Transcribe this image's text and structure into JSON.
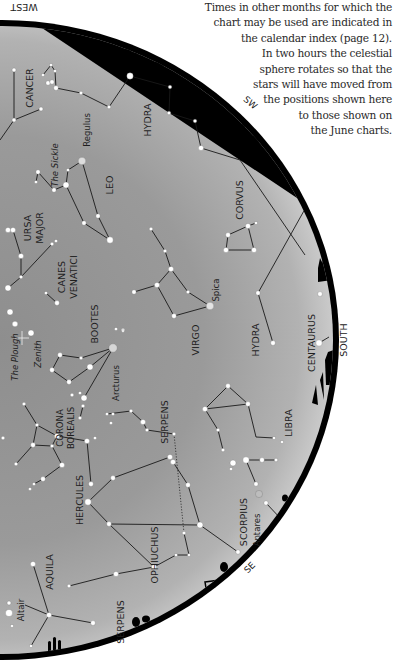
{
  "caption": {
    "lines": [
      "Times in other months for which the",
      "chart may be used are indicated in",
      "the calendar index (page 12).",
      "In two hours the celestial",
      "sphere rotates so that the",
      "stars will have moved from",
      "the positions shown here",
      "to those shown on",
      "the June charts."
    ]
  },
  "directions": {
    "west": "WEST",
    "sw": "SW",
    "south": "SOUTH",
    "se": "SE"
  },
  "colors": {
    "sky_light": "#c9c9c9",
    "sky_dark": "#8a8a8a",
    "rim": "#000000",
    "line": "#1a1a1a",
    "star": "#ffffff"
  },
  "constellations": [
    {
      "name": "CANCER",
      "x": 30,
      "y": 88,
      "rot": -90,
      "size": 9.5
    },
    {
      "name": "HYDRA",
      "x": 148,
      "y": 120,
      "rot": -90,
      "size": 9.5
    },
    {
      "name": "Regulus",
      "x": 87,
      "y": 130,
      "rot": -90,
      "size": 8.5
    },
    {
      "name": "The Sickle",
      "x": 55,
      "y": 165,
      "rot": -90,
      "size": 8.5,
      "italic": true
    },
    {
      "name": "LEO",
      "x": 110,
      "y": 185,
      "rot": -90,
      "size": 9.5
    },
    {
      "name": "URSA",
      "x": 28,
      "y": 228,
      "rot": -90,
      "size": 9.5
    },
    {
      "name": "MAJOR",
      "x": 40,
      "y": 228,
      "rot": -90,
      "size": 9.5
    },
    {
      "name": "CORVUS",
      "x": 240,
      "y": 200,
      "rot": -90,
      "size": 9.5
    },
    {
      "name": "CANES",
      "x": 62,
      "y": 277,
      "rot": -90,
      "size": 9.5
    },
    {
      "name": "VENATICI",
      "x": 74,
      "y": 277,
      "rot": -90,
      "size": 9.5
    },
    {
      "name": "Spica",
      "x": 216,
      "y": 290,
      "rot": -90,
      "size": 8.5
    },
    {
      "name": "BOOTES",
      "x": 95,
      "y": 324,
      "rot": -90,
      "size": 9.5
    },
    {
      "name": "VIRGO",
      "x": 196,
      "y": 340,
      "rot": -90,
      "size": 9.5
    },
    {
      "name": "HYDRA",
      "x": 256,
      "y": 340,
      "rot": -90,
      "size": 9.5
    },
    {
      "name": "CENTAURUS",
      "x": 312,
      "y": 343,
      "rot": -90,
      "size": 9.5
    },
    {
      "name": "The Plough",
      "x": 15,
      "y": 357,
      "rot": -90,
      "size": 8.5,
      "italic": true
    },
    {
      "name": "Zenith",
      "x": 38,
      "y": 354,
      "rot": -90,
      "size": 8.5,
      "italic": true
    },
    {
      "name": "Arcturus",
      "x": 116,
      "y": 383,
      "rot": -90,
      "size": 8.5
    },
    {
      "name": "CORONA",
      "x": 60,
      "y": 428,
      "rot": -90,
      "size": 8.5
    },
    {
      "name": "BOREALIS",
      "x": 71,
      "y": 428,
      "rot": -90,
      "size": 8.5
    },
    {
      "name": "SERPENS",
      "x": 165,
      "y": 422,
      "rot": -90,
      "size": 9.5
    },
    {
      "name": "LIBRA",
      "x": 289,
      "y": 423,
      "rot": -90,
      "size": 9.5
    },
    {
      "name": "HERCULES",
      "x": 80,
      "y": 500,
      "rot": -90,
      "size": 9.5
    },
    {
      "name": "SCORPIUS",
      "x": 244,
      "y": 522,
      "rot": -90,
      "size": 9.5
    },
    {
      "name": "Antares",
      "x": 257,
      "y": 530,
      "rot": -90,
      "size": 8.5
    },
    {
      "name": "OPHIUCHUS",
      "x": 155,
      "y": 555,
      "rot": -90,
      "size": 9.5
    },
    {
      "name": "AQUILA",
      "x": 50,
      "y": 572,
      "rot": -90,
      "size": 9.5
    },
    {
      "name": "Altair",
      "x": 21,
      "y": 610,
      "rot": -90,
      "size": 8.5
    },
    {
      "name": "SERPENS",
      "x": 121,
      "y": 622,
      "rot": -90,
      "size": 9.5
    }
  ],
  "stars": [
    {
      "x": 14,
      "y": 70,
      "r": 2
    },
    {
      "x": 14,
      "y": 120,
      "r": 2
    },
    {
      "x": 41,
      "y": 109,
      "r": 2
    },
    {
      "x": 43,
      "y": 75,
      "r": 1.6
    },
    {
      "x": 51,
      "y": 65,
      "r": 1.6
    },
    {
      "x": 55,
      "y": 71,
      "r": 1.6
    },
    {
      "x": 48,
      "y": 83,
      "r": 2.2
    },
    {
      "x": 52,
      "y": 82,
      "r": 2.2
    },
    {
      "x": 56,
      "y": 88,
      "r": 2.4
    },
    {
      "x": 81,
      "y": 93,
      "r": 1.8
    },
    {
      "x": 109,
      "y": 107,
      "r": 1.8
    },
    {
      "x": 130,
      "y": 76,
      "r": 3.2
    },
    {
      "x": 170,
      "y": 87,
      "r": 1.8
    },
    {
      "x": 169,
      "y": 113,
      "r": 1.8
    },
    {
      "x": 195,
      "y": 121,
      "r": 1.8
    },
    {
      "x": 201,
      "y": 148,
      "r": 2.6
    },
    {
      "x": 82,
      "y": 161,
      "r": 3.8,
      "fill": "#dddddd"
    },
    {
      "x": 68,
      "y": 170,
      "r": 1.6
    },
    {
      "x": 66,
      "y": 185,
      "r": 3
    },
    {
      "x": 54,
      "y": 190,
      "r": 2.2
    },
    {
      "x": 38,
      "y": 172,
      "r": 2.2
    },
    {
      "x": 36,
      "y": 182,
      "r": 1.6
    },
    {
      "x": 98,
      "y": 216,
      "r": 2.2
    },
    {
      "x": 84,
      "y": 223,
      "r": 2.2
    },
    {
      "x": 110,
      "y": 240,
      "r": 3.2
    },
    {
      "x": 8,
      "y": 230,
      "r": 2.6
    },
    {
      "x": 13,
      "y": 230,
      "r": 2.6
    },
    {
      "x": 21,
      "y": 256,
      "r": 2.6
    },
    {
      "x": 21,
      "y": 277,
      "r": 1.8
    },
    {
      "x": 52,
      "y": 244,
      "r": 1.8
    },
    {
      "x": 56,
      "y": 241,
      "r": 1.6
    },
    {
      "x": 8,
      "y": 288,
      "r": 3
    },
    {
      "x": 46,
      "y": 293,
      "r": 1.6
    },
    {
      "x": 57,
      "y": 303,
      "r": 2.4
    },
    {
      "x": 10,
      "y": 312,
      "r": 3
    },
    {
      "x": 15,
      "y": 324,
      "r": 2.8
    },
    {
      "x": 31,
      "y": 333,
      "r": 3
    },
    {
      "x": 151,
      "y": 229,
      "r": 1.8
    },
    {
      "x": 165,
      "y": 251,
      "r": 1.8
    },
    {
      "x": 171,
      "y": 269,
      "r": 2.6
    },
    {
      "x": 157,
      "y": 285,
      "r": 2.6
    },
    {
      "x": 134,
      "y": 292,
      "r": 2.2
    },
    {
      "x": 188,
      "y": 292,
      "r": 1.8
    },
    {
      "x": 210,
      "y": 306,
      "r": 3.8,
      "fill": "#e4e4e4"
    },
    {
      "x": 174,
      "y": 316,
      "r": 2.4
    },
    {
      "x": 173,
      "y": 315,
      "r": 0.1
    },
    {
      "x": 123,
      "y": 330,
      "r": 1.8
    },
    {
      "x": 228,
      "y": 235,
      "r": 2.4
    },
    {
      "x": 248,
      "y": 226,
      "r": 2.6
    },
    {
      "x": 256,
      "y": 223,
      "r": 1.6
    },
    {
      "x": 226,
      "y": 250,
      "r": 2.6
    },
    {
      "x": 254,
      "y": 250,
      "r": 2.6
    },
    {
      "x": 258,
      "y": 293,
      "r": 2.2
    },
    {
      "x": 273,
      "y": 343,
      "r": 2.4
    },
    {
      "x": 320,
      "y": 294,
      "r": 2.4
    },
    {
      "x": 319,
      "y": 343,
      "r": 3.2
    },
    {
      "x": 116,
      "y": 329,
      "r": 1.6
    },
    {
      "x": 123,
      "y": 331,
      "r": 1.4
    },
    {
      "x": 113,
      "y": 348,
      "r": 4.2,
      "fill": "#d6d6d6"
    },
    {
      "x": 60,
      "y": 355,
      "r": 2.4
    },
    {
      "x": 81,
      "y": 358,
      "r": 1.8
    },
    {
      "x": 90,
      "y": 367,
      "r": 3
    },
    {
      "x": 52,
      "y": 370,
      "r": 2.4
    },
    {
      "x": 69,
      "y": 382,
      "r": 2.4
    },
    {
      "x": 72,
      "y": 395,
      "r": 1.8
    },
    {
      "x": 80,
      "y": 393,
      "r": 1.6
    },
    {
      "x": 84,
      "y": 398,
      "r": 3
    },
    {
      "x": 83,
      "y": 406,
      "r": 1.8
    },
    {
      "x": 80,
      "y": 418,
      "r": 1.8
    },
    {
      "x": 107,
      "y": 414,
      "r": 1.6
    },
    {
      "x": 113,
      "y": 414,
      "r": 1.6
    },
    {
      "x": 111,
      "y": 423,
      "r": 1.6
    },
    {
      "x": 131,
      "y": 411,
      "r": 1.8
    },
    {
      "x": 143,
      "y": 422,
      "r": 2.6
    },
    {
      "x": 147,
      "y": 430,
      "r": 1.8
    },
    {
      "x": 174,
      "y": 434,
      "r": 1.8
    },
    {
      "x": 24,
      "y": 404,
      "r": 1.8
    },
    {
      "x": 37,
      "y": 425,
      "r": 1.8
    },
    {
      "x": 33,
      "y": 445,
      "r": 2.4
    },
    {
      "x": 52,
      "y": 446,
      "r": 1.8
    },
    {
      "x": 57,
      "y": 436,
      "r": 2.6
    },
    {
      "x": 87,
      "y": 441,
      "r": 2.6
    },
    {
      "x": 95,
      "y": 438,
      "r": 1.6
    },
    {
      "x": 62,
      "y": 465,
      "r": 2.6
    },
    {
      "x": 16,
      "y": 464,
      "r": 1.8
    },
    {
      "x": 3,
      "y": 438,
      "r": 1.8
    },
    {
      "x": 43,
      "y": 479,
      "r": 2.4
    },
    {
      "x": 34,
      "y": 484,
      "r": 1.6
    },
    {
      "x": 30,
      "y": 489,
      "r": 1.6
    },
    {
      "x": 228,
      "y": 386,
      "r": 2.4
    },
    {
      "x": 205,
      "y": 409,
      "r": 2.6
    },
    {
      "x": 248,
      "y": 404,
      "r": 2.4
    },
    {
      "x": 218,
      "y": 430,
      "r": 1.8
    },
    {
      "x": 223,
      "y": 450,
      "r": 1.8
    },
    {
      "x": 274,
      "y": 438,
      "r": 1.6
    },
    {
      "x": 282,
      "y": 442,
      "r": 1.6
    },
    {
      "x": 170,
      "y": 457,
      "r": 2.6
    },
    {
      "x": 173,
      "y": 462,
      "r": 2.6
    },
    {
      "x": 188,
      "y": 485,
      "r": 2.4
    },
    {
      "x": 91,
      "y": 484,
      "r": 2.4
    },
    {
      "x": 113,
      "y": 478,
      "r": 2.4
    },
    {
      "x": 88,
      "y": 502,
      "r": 3.2
    },
    {
      "x": 109,
      "y": 524,
      "r": 2.4
    },
    {
      "x": 200,
      "y": 525,
      "r": 3
    },
    {
      "x": 184,
      "y": 533,
      "r": 1.8
    },
    {
      "x": 189,
      "y": 555,
      "r": 1.6
    },
    {
      "x": 176,
      "y": 555,
      "r": 1.6
    },
    {
      "x": 154,
      "y": 567,
      "r": 2.6
    },
    {
      "x": 116,
      "y": 574,
      "r": 2.6
    },
    {
      "x": 69,
      "y": 586,
      "r": 1.8
    },
    {
      "x": 233,
      "y": 463,
      "r": 3
    },
    {
      "x": 246,
      "y": 460,
      "r": 3.2
    },
    {
      "x": 262,
      "y": 460,
      "r": 2.4
    },
    {
      "x": 276,
      "y": 460,
      "r": 1.8
    },
    {
      "x": 231,
      "y": 469,
      "r": 1.6
    },
    {
      "x": 256,
      "y": 484,
      "r": 2.2
    },
    {
      "x": 259,
      "y": 494,
      "r": 3.6,
      "fill": "#bdbdbd"
    },
    {
      "x": 266,
      "y": 503,
      "r": 2.2
    },
    {
      "x": 238,
      "y": 552,
      "r": 2.2
    },
    {
      "x": 33,
      "y": 564,
      "r": 2.6
    },
    {
      "x": 49,
      "y": 615,
      "r": 2.6
    },
    {
      "x": 93,
      "y": 623,
      "r": 2.4
    },
    {
      "x": 31,
      "y": 646,
      "r": 1.6
    },
    {
      "x": 9,
      "y": 603,
      "r": 2
    },
    {
      "x": 9,
      "y": 613,
      "r": 3.6
    },
    {
      "x": 12,
      "y": 626,
      "r": 1.6
    }
  ],
  "lines": [
    [
      [
        14,
        70
      ],
      [
        14,
        120
      ],
      [
        41,
        109
      ]
    ],
    [
      [
        14,
        120
      ],
      [
        0,
        140
      ]
    ],
    [
      [
        56,
        88
      ],
      [
        81,
        93
      ],
      [
        109,
        107
      ],
      [
        130,
        76
      ],
      [
        170,
        87
      ],
      [
        169,
        113
      ],
      [
        195,
        121
      ],
      [
        201,
        148
      ],
      [
        240,
        160
      ],
      [
        305,
        255
      ]
    ],
    [
      [
        43,
        75
      ],
      [
        51,
        65
      ],
      [
        55,
        71
      ],
      [
        56,
        88
      ]
    ],
    [
      [
        82,
        161
      ],
      [
        98,
        216
      ],
      [
        110,
        240
      ],
      [
        84,
        223
      ],
      [
        66,
        185
      ],
      [
        68,
        170
      ],
      [
        82,
        161
      ]
    ],
    [
      [
        66,
        185
      ],
      [
        54,
        190
      ],
      [
        38,
        172
      ]
    ],
    [
      [
        36,
        182
      ],
      [
        38,
        172
      ]
    ],
    [
      [
        13,
        230
      ],
      [
        21,
        256
      ],
      [
        21,
        277
      ],
      [
        52,
        244
      ]
    ],
    [
      [
        21,
        277
      ],
      [
        8,
        288
      ]
    ],
    [
      [
        46,
        293
      ],
      [
        57,
        303
      ]
    ],
    [
      [
        151,
        229
      ],
      [
        165,
        251
      ],
      [
        171,
        269
      ],
      [
        157,
        285
      ],
      [
        134,
        292
      ]
    ],
    [
      [
        171,
        269
      ],
      [
        188,
        292
      ],
      [
        210,
        306
      ],
      [
        174,
        316
      ],
      [
        157,
        285
      ]
    ],
    [
      [
        228,
        235
      ],
      [
        248,
        226
      ],
      [
        254,
        250
      ],
      [
        226,
        250
      ],
      [
        228,
        235
      ]
    ],
    [
      [
        248,
        226
      ],
      [
        256,
        223
      ]
    ],
    [
      [
        258,
        293
      ],
      [
        273,
        343
      ]
    ],
    [
      [
        310,
        200
      ],
      [
        258,
        293
      ]
    ],
    [
      [
        319,
        343
      ],
      [
        329,
        337
      ]
    ],
    [
      [
        113,
        348
      ],
      [
        90,
        367
      ],
      [
        69,
        382
      ],
      [
        52,
        370
      ],
      [
        60,
        355
      ],
      [
        81,
        358
      ],
      [
        113,
        348
      ]
    ],
    [
      [
        113,
        348
      ],
      [
        84,
        398
      ]
    ],
    [
      [
        83,
        406
      ],
      [
        80,
        418
      ]
    ],
    [
      [
        107,
        414
      ],
      [
        131,
        411
      ],
      [
        143,
        422
      ],
      [
        147,
        430
      ],
      [
        174,
        434
      ]
    ],
    [
      [
        24,
        404
      ],
      [
        37,
        425
      ],
      [
        57,
        436
      ],
      [
        87,
        441
      ]
    ],
    [
      [
        37,
        425
      ],
      [
        33,
        445
      ],
      [
        52,
        446
      ],
      [
        57,
        436
      ]
    ],
    [
      [
        33,
        445
      ],
      [
        16,
        464
      ]
    ],
    [
      [
        52,
        446
      ],
      [
        62,
        465
      ]
    ],
    [
      [
        62,
        465
      ],
      [
        43,
        479
      ],
      [
        34,
        484
      ]
    ],
    [
      [
        205,
        409
      ],
      [
        228,
        386
      ],
      [
        248,
        404
      ],
      [
        256,
        437
      ],
      [
        274,
        438
      ]
    ],
    [
      [
        205,
        409
      ],
      [
        248,
        404
      ]
    ],
    [
      [
        205,
        409
      ],
      [
        218,
        430
      ],
      [
        223,
        450
      ]
    ],
    [
      [
        87,
        441
      ],
      [
        91,
        484
      ]
    ],
    [
      [
        88,
        502
      ],
      [
        113,
        478
      ],
      [
        170,
        457
      ]
    ],
    [
      [
        88,
        502
      ],
      [
        109,
        524
      ],
      [
        200,
        525
      ]
    ],
    [
      [
        109,
        524
      ],
      [
        154,
        567
      ]
    ],
    [
      [
        173,
        462
      ],
      [
        188,
        485
      ],
      [
        200,
        525
      ]
    ],
    [
      [
        154,
        567
      ],
      [
        116,
        574
      ],
      [
        69,
        586
      ]
    ],
    [
      [
        154,
        567
      ],
      [
        176,
        555
      ],
      [
        189,
        555
      ],
      [
        184,
        533
      ]
    ],
    [
      [
        246,
        460
      ],
      [
        276,
        460
      ]
    ],
    [
      [
        246,
        460
      ],
      [
        256,
        484
      ]
    ],
    [
      [
        266,
        503
      ],
      [
        282,
        520
      ]
    ],
    [
      [
        200,
        525
      ],
      [
        238,
        552
      ]
    ],
    [
      [
        33,
        564
      ],
      [
        49,
        615
      ],
      [
        93,
        623
      ]
    ],
    [
      [
        49,
        615
      ],
      [
        25,
        605
      ]
    ],
    [
      [
        49,
        615
      ],
      [
        31,
        646
      ]
    ]
  ],
  "dotted_lines": [
    [
      [
        174,
        434
      ],
      [
        184,
        533
      ]
    ]
  ],
  "zenith": {
    "x": 22,
    "y": 338
  }
}
